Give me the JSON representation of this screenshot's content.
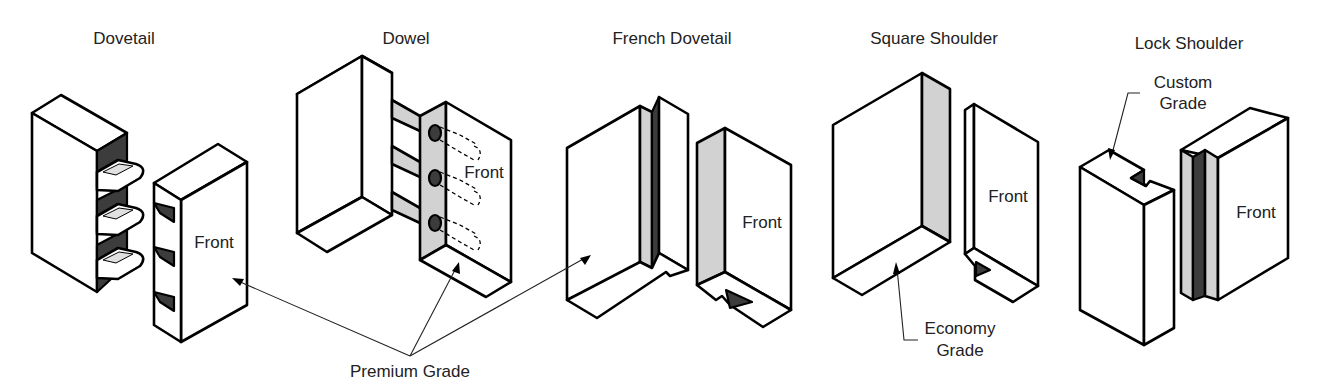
{
  "diagram": {
    "joints": [
      {
        "name": "Dovetail",
        "front_label": "Front",
        "grade": "Premium Grade"
      },
      {
        "name": "Dowel",
        "front_label": "Front",
        "grade": "Premium Grade"
      },
      {
        "name": "French Dovetail",
        "front_label": "Front",
        "grade": "Premium Grade"
      },
      {
        "name": "Square Shoulder",
        "front_label": "Front",
        "grade": "Economy Grade"
      },
      {
        "name": "Lock Shoulder",
        "front_label": "Front",
        "grade": "Custom Grade"
      }
    ],
    "callouts": {
      "premium": "Premium Grade",
      "economy_line1": "Economy",
      "economy_line2": "Grade",
      "custom_line1": "Custom",
      "custom_line2": "Grade"
    },
    "colors": {
      "outline": "#000000",
      "shade_light": "#d2d2d2",
      "shade_dark": "#3c3c3c",
      "background": "#ffffff"
    }
  }
}
